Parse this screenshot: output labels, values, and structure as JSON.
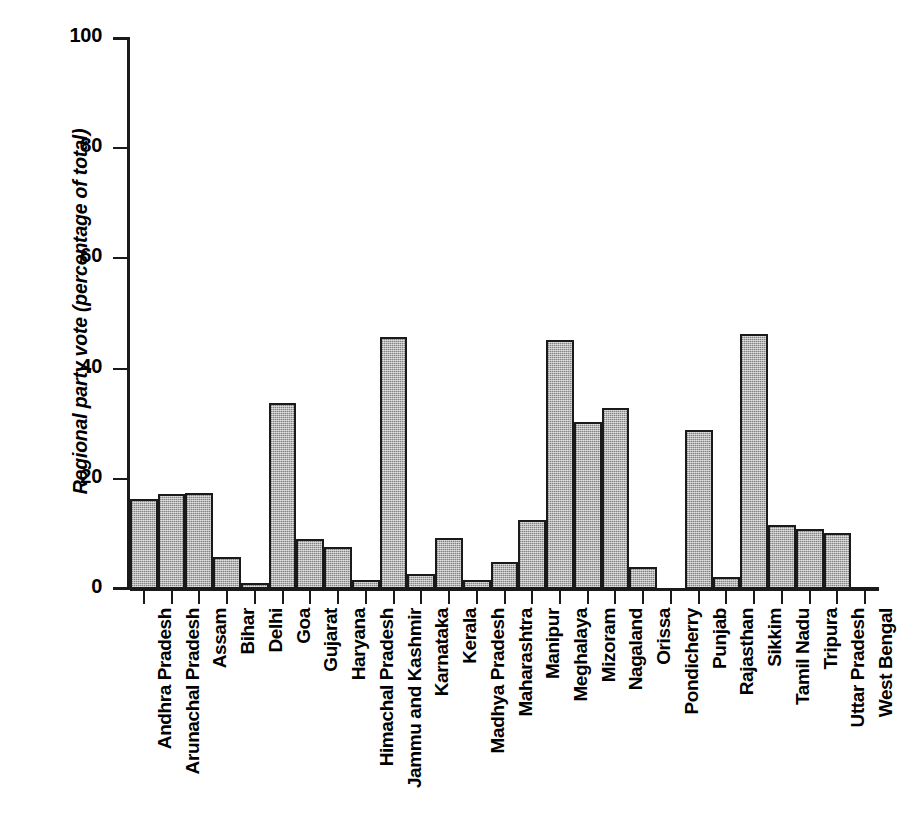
{
  "chart_data": {
    "type": "bar",
    "title": "",
    "subtitle": "",
    "xlabel": "",
    "ylabel": "Regional party vote (percentage of total)",
    "ylim": [
      0,
      100
    ],
    "yticks": [
      0,
      20,
      40,
      60,
      80,
      100
    ],
    "ytick_labels": [
      "0",
      "20",
      "40",
      "60",
      "80",
      "100"
    ],
    "grid": false,
    "legend": null,
    "bar_fill": "#b4b4b4",
    "bar_edge": "#1a1a1a",
    "axis_color": "#1a1a1a",
    "background": "#ffffff",
    "categories": [
      "Andhra Pradesh",
      "Arunachal Pradesh",
      "Assam",
      "Bihar",
      "Delhi",
      "Goa",
      "Gujarat",
      "Haryana",
      "Himachal Pradesh",
      "Jammu and Kashmir",
      "Karnataka",
      "Kerala",
      "Madhya Pradesh",
      "Maharashtra",
      "Manipur",
      "Meghalaya",
      "Mizoram",
      "Nagaland",
      "Orissa",
      "Pondicherry",
      "Punjab",
      "Rajasthan",
      "Sikkim",
      "Tamil Nadu",
      "Tripura",
      "Uttar Pradesh",
      "West Bengal"
    ],
    "values": [
      16.4,
      17.3,
      17.5,
      5.8,
      1.0,
      33.7,
      9.0,
      7.6,
      1.7,
      45.8,
      2.7,
      9.2,
      1.6,
      4.9,
      12.6,
      45.2,
      30.3,
      32.8,
      4.0,
      0.0,
      28.8,
      2.1,
      46.2,
      11.6,
      10.9,
      10.2,
      0.4
    ]
  }
}
